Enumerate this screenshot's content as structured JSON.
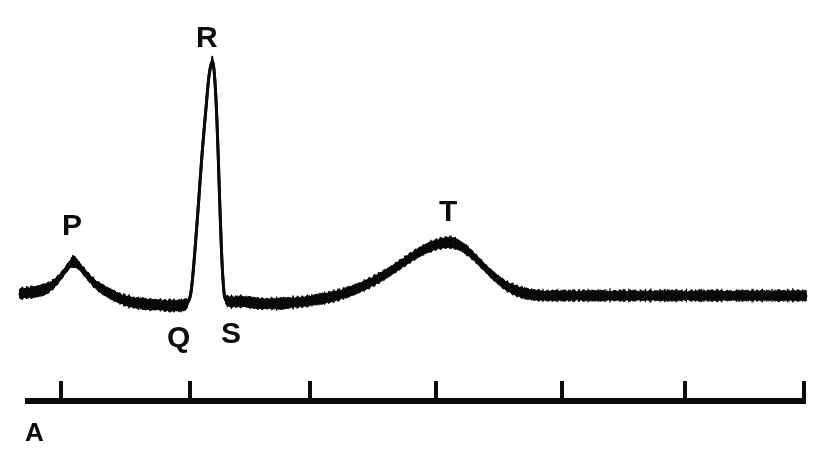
{
  "figure": {
    "panel_id": "A",
    "background_color": "#ffffff",
    "ink_color": "#0b0b0b",
    "width": 824,
    "height": 469
  },
  "wave_labels": [
    {
      "text": "P",
      "x": 62,
      "y": 210
    },
    {
      "text": "R",
      "x": 196,
      "y": 22
    },
    {
      "text": "Q",
      "x": 167,
      "y": 322
    },
    {
      "text": "S",
      "x": 221,
      "y": 318
    },
    {
      "text": "T",
      "x": 439,
      "y": 196
    }
  ],
  "chart_data": {
    "type": "line",
    "title": "",
    "subtitle": "",
    "xlabel": "",
    "ylabel": "",
    "grid": false,
    "legend": null,
    "trace_style": {
      "stroke": "#0b0b0b",
      "stroke_width": 3.0,
      "noise_amplitude_px": 4.5,
      "noise_frequency": 1.4,
      "rendering": "analog-chart-recorder"
    },
    "axis": {
      "x_start_px": 20,
      "x_end_px": 806,
      "baseline_y_px": 296,
      "y_up_is_positive": true
    },
    "annotations": [
      {
        "label": "P",
        "x": 73,
        "y": 262,
        "description": "P wave peak"
      },
      {
        "label": "Q",
        "x": 190,
        "y": 306,
        "description": "Q wave trough"
      },
      {
        "label": "R",
        "x": 212,
        "y": 62,
        "description": "R wave peak"
      },
      {
        "label": "S",
        "x": 223,
        "y": 302,
        "description": "S wave trough"
      },
      {
        "label": "T",
        "x": 452,
        "y": 243,
        "description": "T wave peak"
      }
    ],
    "points": [
      [
        20,
        294
      ],
      [
        28,
        293
      ],
      [
        36,
        292
      ],
      [
        44,
        290
      ],
      [
        50,
        287
      ],
      [
        56,
        282
      ],
      [
        62,
        275
      ],
      [
        68,
        267
      ],
      [
        73,
        262
      ],
      [
        78,
        265
      ],
      [
        84,
        272
      ],
      [
        90,
        279
      ],
      [
        96,
        285
      ],
      [
        103,
        290
      ],
      [
        110,
        294
      ],
      [
        118,
        298
      ],
      [
        126,
        301
      ],
      [
        134,
        303
      ],
      [
        142,
        304
      ],
      [
        150,
        305
      ],
      [
        158,
        305
      ],
      [
        166,
        306
      ],
      [
        174,
        306
      ],
      [
        180,
        306
      ],
      [
        185,
        305
      ],
      [
        188,
        302
      ],
      [
        191,
        292
      ],
      [
        194,
        262
      ],
      [
        198,
        210
      ],
      [
        202,
        155
      ],
      [
        206,
        108
      ],
      [
        209,
        76
      ],
      [
        212,
        62
      ],
      [
        214,
        70
      ],
      [
        216,
        100
      ],
      [
        218,
        150
      ],
      [
        220,
        210
      ],
      [
        222,
        262
      ],
      [
        224,
        292
      ],
      [
        226,
        300
      ],
      [
        230,
        302
      ],
      [
        236,
        302
      ],
      [
        244,
        302
      ],
      [
        252,
        303
      ],
      [
        260,
        304
      ],
      [
        270,
        304
      ],
      [
        280,
        304
      ],
      [
        292,
        303
      ],
      [
        304,
        302
      ],
      [
        316,
        300
      ],
      [
        328,
        298
      ],
      [
        340,
        295
      ],
      [
        352,
        291
      ],
      [
        364,
        286
      ],
      [
        376,
        280
      ],
      [
        388,
        273
      ],
      [
        400,
        265
      ],
      [
        412,
        257
      ],
      [
        424,
        250
      ],
      [
        436,
        245
      ],
      [
        446,
        243
      ],
      [
        452,
        243
      ],
      [
        458,
        245
      ],
      [
        466,
        250
      ],
      [
        474,
        257
      ],
      [
        482,
        265
      ],
      [
        490,
        273
      ],
      [
        498,
        280
      ],
      [
        506,
        286
      ],
      [
        514,
        290
      ],
      [
        522,
        293
      ],
      [
        532,
        295
      ],
      [
        544,
        296
      ],
      [
        558,
        296
      ],
      [
        572,
        296
      ],
      [
        588,
        296
      ],
      [
        604,
        296
      ],
      [
        620,
        296
      ],
      [
        638,
        296
      ],
      [
        656,
        296
      ],
      [
        674,
        296
      ],
      [
        692,
        296
      ],
      [
        710,
        296
      ],
      [
        728,
        296
      ],
      [
        746,
        296
      ],
      [
        764,
        296
      ],
      [
        782,
        296
      ],
      [
        796,
        296
      ],
      [
        806,
        296
      ]
    ]
  },
  "scale_bar": {
    "name": "time-scale-bar",
    "y_px": 401,
    "x_start_px": 25,
    "x_end_px": 806,
    "bar_thickness_px": 6,
    "tick_height_px": 17,
    "tick_width_px": 4,
    "tick_count": 7,
    "tick_positions_px": [
      61,
      190,
      310,
      436,
      562,
      685,
      804
    ],
    "unit_label": ""
  }
}
